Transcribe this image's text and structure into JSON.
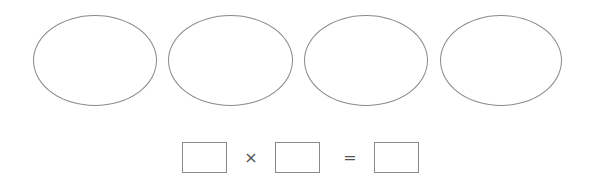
{
  "diagram": {
    "ellipses": [
      {
        "id": 1,
        "content": ""
      },
      {
        "id": 2,
        "content": ""
      },
      {
        "id": 3,
        "content": ""
      },
      {
        "id": 4,
        "content": ""
      }
    ],
    "equation": {
      "operand1": "",
      "operator_times": "×",
      "operand2": "",
      "operator_equals": "=",
      "result": ""
    },
    "colors": {
      "stroke": "#8a8a8a",
      "background": "#ffffff"
    }
  }
}
